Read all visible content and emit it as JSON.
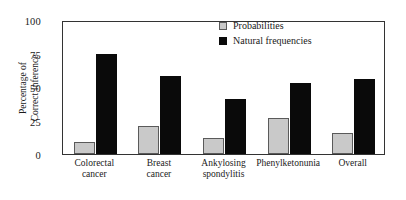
{
  "chart_data": {
    "type": "bar",
    "title": "",
    "xlabel": "",
    "ylabel": "Percentage of Correct Inference",
    "ylabel_lines": [
      "Percentage of",
      "Correct Inference"
    ],
    "ylim": [
      0,
      100
    ],
    "yticks": [
      0,
      25,
      50,
      75,
      100
    ],
    "ytick_labels": [
      "0",
      "25",
      "50",
      "75",
      "100"
    ],
    "grid": false,
    "legend_position": "top-right",
    "categories": [
      "Colorectal cancer",
      "Breast cancer",
      "Ankylosing spondylitis",
      "Phenylketonunia",
      "Overall"
    ],
    "category_lines": [
      [
        "Colorectal",
        "cancer"
      ],
      [
        "Breast",
        "cancer"
      ],
      [
        "Ankylosing",
        "spondylitis"
      ],
      [
        "Phenylketonunia"
      ],
      [
        "Overall"
      ]
    ],
    "series": [
      {
        "name": "Probabilities",
        "color": "#c9c9c9",
        "values": [
          9,
          21,
          12,
          27,
          16
        ]
      },
      {
        "name": "Natural frequencies",
        "color": "#0a0a0a",
        "values": [
          75,
          58,
          41,
          53,
          56
        ]
      }
    ]
  },
  "legend": {
    "items": [
      {
        "label": "Probabilities",
        "swatch": "light-gray"
      },
      {
        "label": "Natural frequencies",
        "swatch": "black"
      }
    ]
  }
}
